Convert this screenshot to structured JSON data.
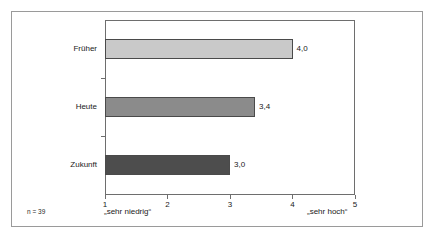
{
  "figure": {
    "n_note": "n = 39",
    "frame_color": "#9a9a9a",
    "axis_color": "#6e6e6e"
  },
  "chart_data": {
    "type": "bar",
    "orientation": "horizontal",
    "title": "",
    "subtitle": "",
    "xlabel": "",
    "ylabel": "",
    "categories": [
      "Früher",
      "Heute",
      "Zukunft"
    ],
    "values": [
      4.0,
      3.4,
      3.0
    ],
    "value_labels": [
      "4,0",
      "3,4",
      "3,0"
    ],
    "xlim": [
      1,
      5
    ],
    "xticks": [
      1,
      2,
      3,
      4,
      5
    ],
    "xtick_labels": [
      "1",
      "2",
      "3",
      "4",
      "5"
    ],
    "grid": false,
    "legend": "none",
    "scale_anchor_low": "„sehr niedrig“",
    "scale_anchor_high": "„sehr hoch“",
    "bar_colors": [
      "#c9c9c9",
      "#8b8b8b",
      "#4d4d4d"
    ],
    "bar_edge_color": "#4a4a4a",
    "annotation": "n = 39"
  }
}
